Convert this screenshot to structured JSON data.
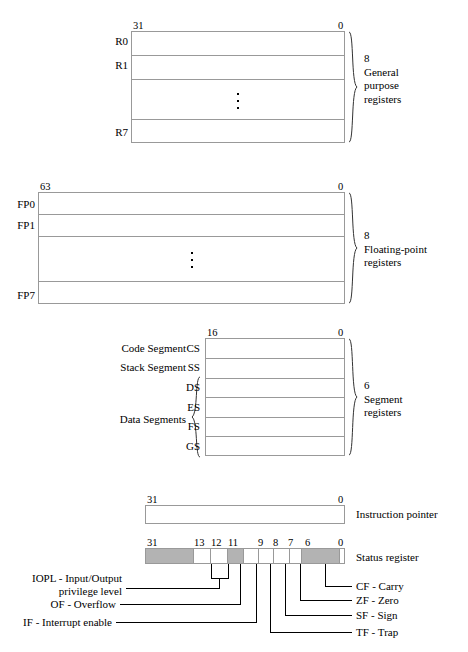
{
  "figure": {
    "colors": {
      "reserved_fill": "#b3b3b3",
      "box_stroke": "#999999",
      "text": "#000000",
      "background": "#ffffff"
    }
  },
  "general_purpose": {
    "bit_high": "31",
    "bit_low": "0",
    "row_names": [
      "R0",
      "R1",
      "R7"
    ],
    "ellipsis": "vertical-dots",
    "count": "8",
    "note_lines": [
      "8",
      "General",
      "purpose",
      "registers"
    ]
  },
  "floating_point": {
    "bit_high": "63",
    "bit_low": "0",
    "row_names": [
      "FP0",
      "FP1",
      "FP7"
    ],
    "ellipsis": "vertical-dots",
    "count": "8",
    "note_lines": [
      "8",
      "Floating-point",
      "registers"
    ]
  },
  "segment": {
    "bit_high": "16",
    "bit_low": "0",
    "rows": [
      {
        "name": "CS",
        "desc": "Code Segment"
      },
      {
        "name": "SS",
        "desc": "Stack Segment"
      },
      {
        "name": "DS",
        "desc": ""
      },
      {
        "name": "ES",
        "desc": ""
      },
      {
        "name": "FS",
        "desc": ""
      },
      {
        "name": "GS",
        "desc": ""
      }
    ],
    "group_label": "Data Segments",
    "count": "6",
    "note_lines": [
      "6",
      "Segment",
      "registers"
    ]
  },
  "instruction_pointer": {
    "bit_high": "31",
    "bit_low": "0",
    "label": "Instruction pointer"
  },
  "status_register": {
    "label": "Status register",
    "bit_labels": [
      "31",
      "13",
      "12",
      "11",
      "9",
      "8",
      "7",
      "6",
      "0"
    ],
    "cells": [
      {
        "kind": "reserved"
      },
      {
        "kind": "flag",
        "bit": "13"
      },
      {
        "kind": "flag",
        "bit": "12"
      },
      {
        "kind": "flag",
        "bit": "11"
      },
      {
        "kind": "reserved",
        "bit": "10"
      },
      {
        "kind": "flag",
        "bit": "9"
      },
      {
        "kind": "flag",
        "bit": "8"
      },
      {
        "kind": "flag",
        "bit": "7"
      },
      {
        "kind": "reserved"
      }
    ],
    "left_flags": [
      {
        "abbr": "IOPL",
        "name": "Input/Output privilege level",
        "text_line1": "IOPL - Input/Output",
        "text_line2": "privilege level"
      },
      {
        "abbr": "OF",
        "name": "Overflow",
        "text_line1": "OF - Overflow"
      },
      {
        "abbr": "IF",
        "name": "Interrupt enable",
        "text_line1": "IF - Interrupt enable"
      }
    ],
    "right_flags": [
      {
        "abbr": "CF",
        "name": "Carry",
        "text": "CF - Carry"
      },
      {
        "abbr": "ZF",
        "name": "Zero",
        "text": "ZF - Zero"
      },
      {
        "abbr": "SF",
        "name": "Sign",
        "text": "SF - Sign"
      },
      {
        "abbr": "TF",
        "name": "Trap",
        "text": "TF - Trap"
      }
    ]
  }
}
